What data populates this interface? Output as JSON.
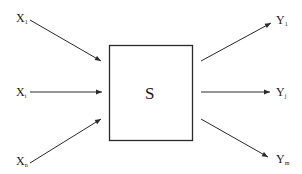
{
  "diagram": {
    "system": {
      "label": "S"
    },
    "inputs": [
      {
        "base": "X",
        "sub": "1"
      },
      {
        "base": "X",
        "sub": "i"
      },
      {
        "base": "X",
        "sub": "n"
      }
    ],
    "outputs": [
      {
        "base": "Y",
        "sub": "1"
      },
      {
        "base": "Y",
        "sub": "j"
      },
      {
        "base": "Y",
        "sub": "m"
      }
    ],
    "colors": {
      "stroke": "#2a2a2a",
      "background": "#ffffff"
    }
  }
}
